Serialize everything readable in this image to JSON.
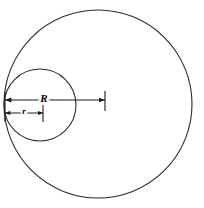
{
  "figure": {
    "background_color": "#ffffff",
    "stroke_color": "#1a1a1a",
    "label_color": "#000000",
    "width": 204,
    "height": 208
  },
  "shapes": {
    "outer_circle": {
      "name": "outer-circle",
      "cx": 98,
      "cy": 104,
      "radius": 94,
      "stroke_width": 1.1,
      "stroke_color": "#2b2b2b"
    },
    "inner_circle": {
      "name": "inner-circle",
      "cx": 40,
      "cy": 105,
      "radius": 36,
      "stroke_width": 1.1,
      "stroke_color": "#2b2b2b"
    }
  },
  "dimensions": [
    {
      "id": "R",
      "label": "R",
      "label_x": 44,
      "label_y": 99,
      "line_y": 100,
      "x_start": 5,
      "x_end": 105,
      "arrow_start": true,
      "arrow_end": true,
      "end_tick": true,
      "tick_top": 91,
      "tick_bottom": 111,
      "stroke_width": 1.1
    },
    {
      "id": "r",
      "label": "r",
      "label_x": 24,
      "label_y": 112,
      "line_y": 113,
      "x_start": 5,
      "x_end": 43,
      "arrow_start": true,
      "arrow_end": true,
      "end_tick": true,
      "tick_top": 105,
      "tick_bottom": 122,
      "stroke_width": 1.1
    }
  ],
  "tangent_point": {
    "name": "left-tangent-point",
    "x": 5,
    "y": 104,
    "tick_top": 92,
    "tick_bottom": 122
  },
  "label_font_sizes": {
    "R": 11,
    "r": 9
  }
}
